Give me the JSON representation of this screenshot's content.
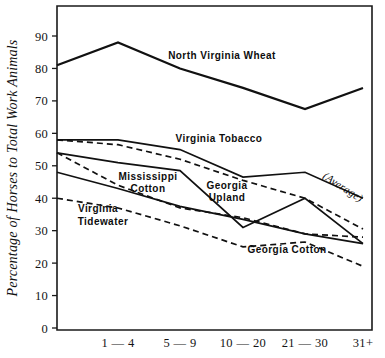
{
  "chart_data": {
    "type": "line",
    "title": "",
    "xlabel": "",
    "ylabel": "Percentage of Horses to Total Work Animals",
    "ylim": [
      0,
      90
    ],
    "yticks": [
      0,
      10,
      20,
      30,
      40,
      50,
      60,
      70,
      80,
      90
    ],
    "ytick_labels": [
      "0",
      "10",
      "20",
      "30",
      "40",
      "50",
      "60",
      "70",
      "80",
      "90"
    ],
    "categories": [
      "",
      "1 — 4",
      "5 — 9",
      "10 — 20",
      "21 — 30",
      "31+"
    ],
    "grid": false,
    "legend": "inline-annotations",
    "series": [
      {
        "name": "North Virginia Wheat",
        "style": "solid",
        "values": [
          81,
          88,
          80,
          74,
          67.5,
          74
        ],
        "label": "North  Virginia  Wheat",
        "label_x": 222,
        "label_y": 59,
        "label_rotate": 0,
        "label_anchor": "middle"
      },
      {
        "name": "Virginia Tobacco",
        "style": "solid",
        "values": [
          58,
          58,
          55,
          46.5,
          48,
          40
        ],
        "label": "Virginia  Tobacco",
        "label_x": 219,
        "label_y": 142,
        "label_rotate": 0,
        "label_anchor": "middle"
      },
      {
        "name": "(Average)",
        "style": "dashed",
        "values": [
          58,
          56.5,
          52,
          45.5,
          40,
          30.5
        ],
        "label": "(Average)",
        "label_x": 341,
        "label_y": 190,
        "label_rotate": 33,
        "label_anchor": "middle"
      },
      {
        "name": "Mississippi Cotton",
        "style": "solid",
        "values": [
          54,
          51,
          48.5,
          31,
          40,
          26
        ],
        "label": "Mississippi",
        "label_x": 148,
        "label_y": 180,
        "label_rotate": 0,
        "label_anchor": "middle"
      },
      {
        "name": "Georgia Upland",
        "style": "dashed",
        "values": [
          54,
          44,
          37,
          34,
          29,
          28
        ],
        "label": "Georgia",
        "label_x": 227,
        "label_y": 189,
        "label_rotate": 0,
        "label_anchor": "middle"
      },
      {
        "name": "Virginia Tidewater",
        "style": "solid",
        "values": [
          48,
          43,
          37.5,
          33.5,
          29,
          26
        ],
        "label": "Virginia",
        "label_x": 98,
        "label_y": 212,
        "label_rotate": 0,
        "label_anchor": "middle"
      },
      {
        "name": "Georgia Cotton",
        "style": "dashed",
        "values": [
          40,
          37,
          31.5,
          25,
          26.5,
          19
        ],
        "label": "Georgia  Cotton",
        "label_x": 287,
        "label_y": 253,
        "label_rotate": 0,
        "label_anchor": "middle"
      }
    ],
    "annotations": [
      {
        "text": "North  Virginia  Wheat",
        "x": 222,
        "y": 59,
        "anchor": "middle",
        "rotate": 0,
        "italic": false
      },
      {
        "text": "Virginia  Tobacco",
        "x": 219,
        "y": 142,
        "anchor": "middle",
        "rotate": 0,
        "italic": false
      },
      {
        "text": "Mississippi",
        "x": 148,
        "y": 180,
        "anchor": "middle",
        "rotate": 0,
        "italic": false
      },
      {
        "text": "Cotton",
        "x": 148,
        "y": 192,
        "anchor": "middle",
        "rotate": 0,
        "italic": false
      },
      {
        "text": "Georgia",
        "x": 227,
        "y": 189,
        "anchor": "middle",
        "rotate": 0,
        "italic": false
      },
      {
        "text": "Upland",
        "x": 227,
        "y": 201,
        "anchor": "middle",
        "rotate": 0,
        "italic": false
      },
      {
        "text": "Virginia",
        "x": 98,
        "y": 212,
        "anchor": "middle",
        "rotate": 0,
        "italic": false
      },
      {
        "text": "Tidewater",
        "x": 103,
        "y": 225,
        "anchor": "middle",
        "rotate": 0,
        "italic": false
      },
      {
        "text": "(Average)",
        "x": 341,
        "y": 190,
        "anchor": "middle",
        "rotate": 33,
        "italic": true
      },
      {
        "text": "Georgia  Cotton",
        "x": 287,
        "y": 253,
        "anchor": "middle",
        "rotate": 0,
        "italic": false
      }
    ],
    "geometry": {
      "plot_left": 57,
      "plot_right": 372,
      "plot_top": 6,
      "plot_bottom": 330,
      "y_zero_px": 328,
      "y_per_unit_px": 3.2444,
      "x_positions": [
        57,
        118,
        180,
        243,
        305,
        363
      ]
    }
  }
}
